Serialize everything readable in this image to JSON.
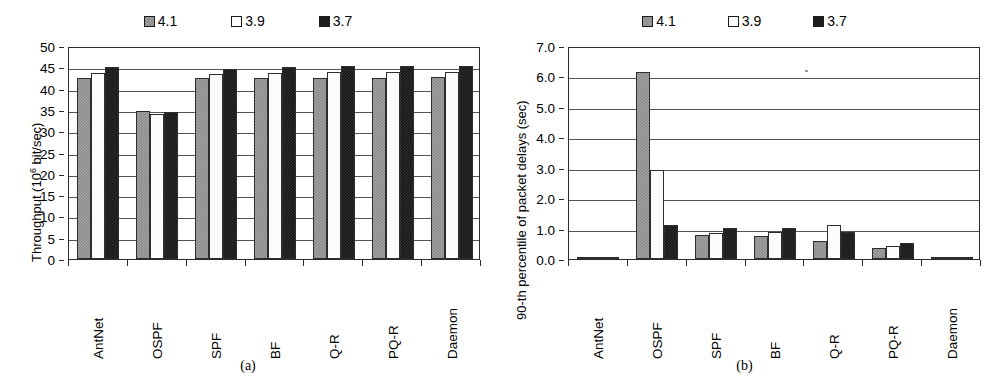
{
  "figure": {
    "panels": [
      {
        "caption": "(a)",
        "legend": [
          {
            "label": "4.1",
            "swatch": "gray-hatch",
            "color": "#8b8b8b"
          },
          {
            "label": "3.9",
            "swatch": "white",
            "color": "#fbfbfb"
          },
          {
            "label": "3.7",
            "swatch": "black",
            "color": "#191919"
          }
        ]
      },
      {
        "caption": "(b)",
        "legend": [
          {
            "label": "4.1",
            "swatch": "gray-hatch",
            "color": "#8b8b8b"
          },
          {
            "label": "3.9",
            "swatch": "white",
            "color": "#fbfbfb"
          },
          {
            "label": "3.7",
            "swatch": "black",
            "color": "#191919"
          }
        ]
      }
    ]
  },
  "chart_data": [
    {
      "type": "bar",
      "title": "",
      "xlabel": "",
      "ylabel": "Throughput (10⁶ bit/sec)",
      "ylabel_base": "Throughput (10",
      "ylabel_exp": "6",
      "ylabel_tail": " bit/sec)",
      "categories": [
        "AntNet",
        "OSPF",
        "SPF",
        "BF",
        "Q-R",
        "PQ-R",
        "Daemon"
      ],
      "yticks": [
        "0",
        "5",
        "10",
        "15",
        "20",
        "25",
        "30",
        "35",
        "40",
        "45",
        "50"
      ],
      "ylim": [
        0,
        50
      ],
      "grid": true,
      "legend_position": "top-center",
      "series": [
        {
          "name": "4.1",
          "values": [
            42.5,
            34.8,
            42.4,
            42.6,
            42.6,
            42.6,
            42.7
          ]
        },
        {
          "name": "3.9",
          "values": [
            43.7,
            34.0,
            43.5,
            43.6,
            43.8,
            43.9,
            44.0
          ]
        },
        {
          "name": "3.7",
          "values": [
            45.1,
            34.5,
            44.7,
            45.1,
            45.2,
            45.2,
            45.3
          ]
        }
      ]
    },
    {
      "type": "bar",
      "title": "",
      "xlabel": "",
      "ylabel": "90-th percentile of packet delays (sec)",
      "categories": [
        "AntNet",
        "OSPF",
        "SPF",
        "BF",
        "Q-R",
        "PQ-R",
        "Daemon"
      ],
      "yticks": [
        "0.0",
        "1.0",
        "2.0",
        "3.0",
        "4.0",
        "5.0",
        "6.0",
        "7.0"
      ],
      "ylim": [
        0,
        7
      ],
      "grid": true,
      "legend_position": "top-center",
      "series": [
        {
          "name": "4.1",
          "values": [
            0.05,
            6.15,
            0.8,
            0.74,
            0.59,
            0.35,
            0.03
          ]
        },
        {
          "name": "3.9",
          "values": [
            0.05,
            2.92,
            0.87,
            0.88,
            1.11,
            0.44,
            0.04
          ]
        },
        {
          "name": "3.7",
          "values": [
            0.05,
            1.11,
            1.01,
            1.02,
            0.88,
            0.51,
            0.04
          ]
        }
      ]
    }
  ]
}
